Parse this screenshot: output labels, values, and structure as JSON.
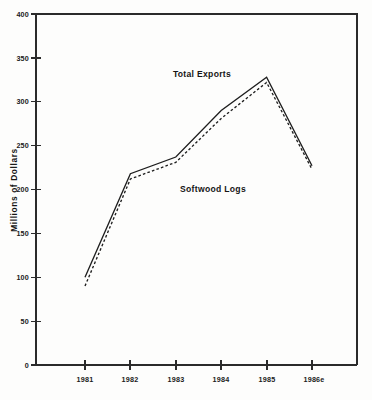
{
  "chart_data": {
    "type": "line",
    "title": "",
    "subtitle": "",
    "xlabel": "",
    "ylabel": "Millions of Dollars",
    "categories": [
      "1981",
      "1982",
      "1983",
      "1984",
      "1985",
      "1986e"
    ],
    "x_tick_labels": [
      "1981",
      "1982",
      "1983",
      "1984",
      "1985",
      "1986e"
    ],
    "y_tick_labels": [
      "0",
      "50",
      "100",
      "150",
      "200",
      "250",
      "300",
      "350",
      "400"
    ],
    "y_ticks": [
      0,
      50,
      100,
      150,
      200,
      250,
      300,
      350,
      400
    ],
    "ylim": [
      0,
      400
    ],
    "grid": false,
    "legend_position": "inline-annotations",
    "series": [
      {
        "name": "Total Exports",
        "style": "solid",
        "color": "#1e1e1e",
        "values": [
          100,
          218,
          237,
          290,
          328,
          227
        ]
      },
      {
        "name": "Softwood Logs",
        "style": "dashed",
        "color": "#1e1e1e",
        "values": [
          90,
          212,
          231,
          281,
          322,
          223
        ]
      }
    ],
    "annotations": [
      {
        "text": "Total Exports",
        "x": 1983.1,
        "y": 345
      },
      {
        "text": "Softwood Logs",
        "x": 1983.3,
        "y": 215
      }
    ]
  },
  "axes": {
    "y_axis_title": "Millions of Dollars",
    "x_axis_title": ""
  }
}
